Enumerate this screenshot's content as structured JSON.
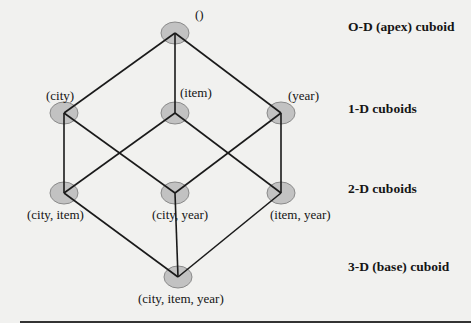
{
  "diagram": {
    "node_color": "#c2c2c2",
    "node_stroke": "#8a8a8a",
    "edge_color": "#1a1a1a",
    "nodes": [
      {
        "id": "apex",
        "label": "()",
        "x": 175,
        "y": 33,
        "level": 0
      },
      {
        "id": "city",
        "label": "(city)",
        "x": 64,
        "y": 113,
        "level": 1
      },
      {
        "id": "item",
        "label": "(item)",
        "x": 175,
        "y": 113,
        "level": 1
      },
      {
        "id": "year",
        "label": "(year)",
        "x": 281,
        "y": 113,
        "level": 1
      },
      {
        "id": "city_item",
        "label": "(city, item)",
        "x": 64,
        "y": 193,
        "level": 2
      },
      {
        "id": "city_year",
        "label": "(city, year)",
        "x": 175,
        "y": 193,
        "level": 2
      },
      {
        "id": "item_year",
        "label": "(item, year)",
        "x": 281,
        "y": 193,
        "level": 2
      },
      {
        "id": "base",
        "label": "(city, item, year)",
        "x": 178,
        "y": 277,
        "level": 3
      }
    ],
    "edges": [
      [
        "apex",
        "city"
      ],
      [
        "apex",
        "item"
      ],
      [
        "apex",
        "year"
      ],
      [
        "city",
        "city_item"
      ],
      [
        "city",
        "city_year"
      ],
      [
        "item",
        "city_item"
      ],
      [
        "item",
        "item_year"
      ],
      [
        "year",
        "city_year"
      ],
      [
        "year",
        "item_year"
      ],
      [
        "city_item",
        "base"
      ],
      [
        "city_year",
        "base"
      ],
      [
        "item_year",
        "base"
      ]
    ],
    "levels": [
      {
        "label": "O-D (apex) cuboid",
        "y": 33
      },
      {
        "label": "1-D cuboids",
        "y": 113
      },
      {
        "label": "2-D cuboids",
        "y": 193
      },
      {
        "label": "3-D  (base) cuboid",
        "y": 277
      }
    ]
  }
}
